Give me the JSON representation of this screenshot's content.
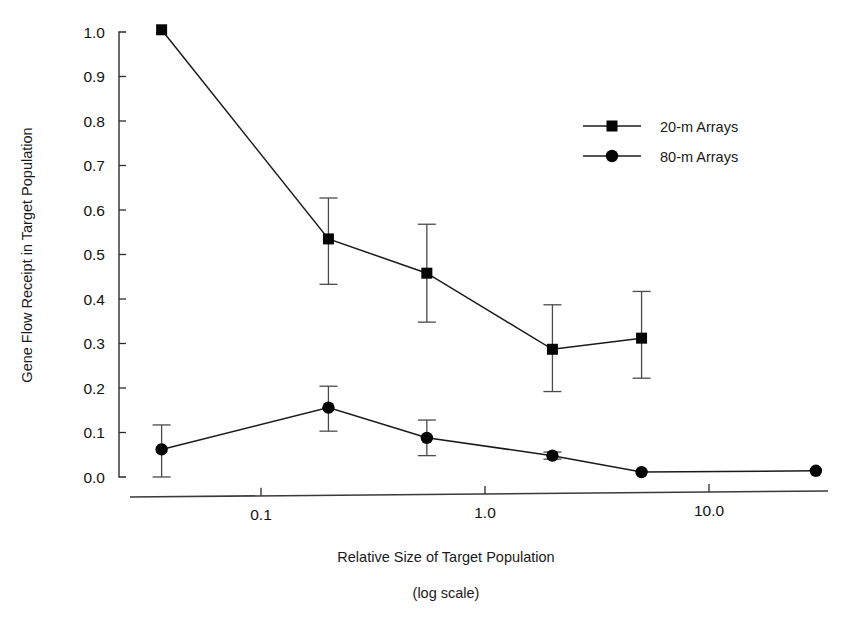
{
  "chart_data": {
    "type": "line",
    "title": "",
    "xlabel": "Relative Size of Target Population",
    "xlabel_sub": "(log scale)",
    "ylabel": "Gene Flow Receipt in Target Population",
    "xscale": "log",
    "yscale": "linear",
    "xlim": [
      0.03,
      33.0
    ],
    "ylim": [
      0.0,
      1.0
    ],
    "grid": false,
    "legend_position": "top-right",
    "x_tick_values": [
      0.1,
      1.0,
      10.0
    ],
    "x_tick_labels": [
      "0.1",
      "1.0",
      "10.0"
    ],
    "y_tick_values": [
      0.0,
      0.1,
      0.2,
      0.3,
      0.4,
      0.5,
      0.6,
      0.7,
      0.8,
      0.9,
      1.0
    ],
    "y_tick_labels": [
      "0.0",
      "0.1",
      "0.2",
      "0.3",
      "0.4",
      "0.5",
      "0.6",
      "0.7",
      "0.8",
      "0.9",
      "1.0"
    ],
    "series": [
      {
        "name": "20-m Arrays",
        "marker": "square",
        "x": [
          0.036,
          0.2,
          0.55,
          2.0,
          5.0
        ],
        "values": [
          1.005,
          0.535,
          0.458,
          0.287,
          0.312
        ],
        "err_low": [
          null,
          0.102,
          0.11,
          0.095,
          0.09
        ],
        "err_high": [
          null,
          0.092,
          0.11,
          0.1,
          0.105
        ]
      },
      {
        "name": "80-m Arrays",
        "marker": "circle",
        "x": [
          0.036,
          0.2,
          0.55,
          2.0,
          5.0,
          30.0
        ],
        "values": [
          0.062,
          0.156,
          0.088,
          0.048,
          0.011,
          0.014
        ],
        "err_low": [
          0.062,
          0.053,
          0.04,
          0.008,
          null,
          null
        ],
        "err_high": [
          0.055,
          0.048,
          0.04,
          0.008,
          null,
          null
        ]
      }
    ]
  },
  "legend": {
    "entries": [
      {
        "label": "20-m Arrays",
        "marker": "square"
      },
      {
        "label": "80-m Arrays",
        "marker": "circle"
      }
    ]
  }
}
